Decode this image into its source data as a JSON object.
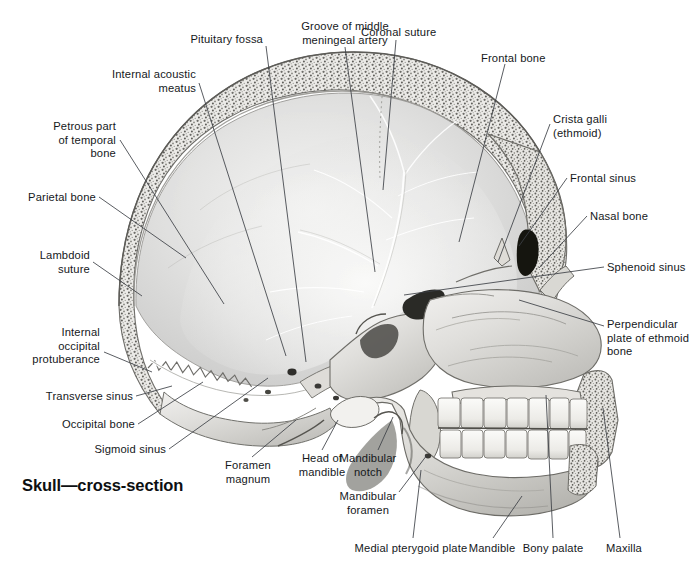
{
  "plate": {
    "title": "Skull—cross-section",
    "title_pos": {
      "x": 22,
      "y": 476
    },
    "background": "#ffffff",
    "ink": "#15181b",
    "leader_color": "#3c4046",
    "width": 697,
    "height": 577
  },
  "labels": [
    {
      "id": "pituitary-fossa",
      "text": "Pituitary fossa",
      "align": "right",
      "x": 263,
      "y": 33,
      "lines": 1,
      "leader": [
        [
          266,
          46
        ],
        [
          306,
          362
        ]
      ]
    },
    {
      "id": "groove-of-middle-meningeal-artery",
      "text": "Groove of middle\nmeningeal artery",
      "align": "center",
      "x": 345,
      "y": 20,
      "lines": 2,
      "leader": [
        [
          345,
          47
        ],
        [
          375,
          272
        ]
      ]
    },
    {
      "id": "coronal-suture",
      "text": "Coronal suture",
      "align": "left",
      "x": 361,
      "y": 26,
      "lines": 1,
      "leader": [
        [
          396,
          40
        ],
        [
          383,
          190
        ]
      ]
    },
    {
      "id": "frontal-bone",
      "text": "Frontal bone",
      "align": "left",
      "x": 481,
      "y": 52,
      "lines": 1,
      "leader": [
        [
          505,
          64
        ],
        [
          459,
          242
        ]
      ]
    },
    {
      "id": "internal-acoustic-meatus",
      "text": "Internal acoustic\nmeatus",
      "align": "right",
      "x": 196,
      "y": 68,
      "lines": 2,
      "leader": [
        [
          199,
          83
        ],
        [
          286,
          356
        ]
      ]
    },
    {
      "id": "crista-galli-ethmoid",
      "text": "Crista galli\n(ethmoid)",
      "align": "left",
      "x": 553,
      "y": 113,
      "lines": 2,
      "leader": [
        [
          550,
          124
        ],
        [
          498,
          262
        ]
      ]
    },
    {
      "id": "petrous-part-of-temporal-bone",
      "text": "Petrous part\nof temporal\nbone",
      "align": "right",
      "x": 116,
      "y": 120,
      "lines": 3,
      "leader": [
        [
          120,
          140
        ],
        [
          224,
          304
        ]
      ]
    },
    {
      "id": "frontal-sinus",
      "text": "Frontal sinus",
      "align": "left",
      "x": 570,
      "y": 172,
      "lines": 1,
      "leader": [
        [
          567,
          178
        ],
        [
          519,
          246
        ]
      ]
    },
    {
      "id": "parietal-bone",
      "text": "Parietal bone",
      "align": "right",
      "x": 96,
      "y": 191,
      "lines": 1,
      "leader": [
        [
          99,
          197
        ],
        [
          186,
          258
        ]
      ]
    },
    {
      "id": "nasal-bone",
      "text": "Nasal bone",
      "align": "left",
      "x": 590,
      "y": 210,
      "lines": 1,
      "leader": [
        [
          587,
          216
        ],
        [
          539,
          268
        ]
      ]
    },
    {
      "id": "lambdoid-suture",
      "text": "Lambdoid\nsuture",
      "align": "right",
      "x": 90,
      "y": 249,
      "lines": 2,
      "leader": [
        [
          93,
          262
        ],
        [
          142,
          296
        ]
      ]
    },
    {
      "id": "sphenoid-sinus",
      "text": "Sphenoid sinus",
      "align": "left",
      "x": 607,
      "y": 261,
      "lines": 1,
      "leader": [
        [
          604,
          267
        ],
        [
          404,
          295
        ]
      ]
    },
    {
      "id": "perpendicular-plate-of-ethmoid-bone",
      "text": "Perpendicular\nplate of ethmoid\nbone",
      "align": "left",
      "x": 607,
      "y": 318,
      "lines": 3,
      "leader": [
        [
          604,
          326
        ],
        [
          519,
          300
        ]
      ]
    },
    {
      "id": "internal-occipital-protuberance",
      "text": "Internal\noccipital\nprotuberance",
      "align": "right",
      "x": 100,
      "y": 326,
      "lines": 3,
      "leader": [
        [
          104,
          352
        ],
        [
          152,
          372
        ]
      ]
    },
    {
      "id": "transverse-sinus",
      "text": "Transverse sinus",
      "align": "right",
      "x": 133,
      "y": 390,
      "lines": 1,
      "leader": [
        [
          136,
          396
        ],
        [
          172,
          386
        ]
      ]
    },
    {
      "id": "occipital-bone",
      "text": "Occipital bone",
      "align": "right",
      "x": 135,
      "y": 418,
      "lines": 1,
      "leader": [
        [
          138,
          424
        ],
        [
          203,
          382
        ]
      ]
    },
    {
      "id": "sigmoid-sinus",
      "text": "Sigmoid sinus",
      "align": "right",
      "x": 166,
      "y": 443,
      "lines": 1,
      "leader": [
        [
          169,
          449
        ],
        [
          268,
          378
        ]
      ]
    },
    {
      "id": "foramen-magnum",
      "text": "Foramen\nmagnum",
      "align": "center",
      "x": 248,
      "y": 459,
      "lines": 2,
      "leader": [
        [
          252,
          457
        ],
        [
          296,
          420
        ]
      ]
    },
    {
      "id": "head-of-mandible",
      "text": "Head of\nmandible",
      "align": "center",
      "x": 322,
      "y": 452,
      "lines": 2,
      "leader": [
        [
          322,
          450
        ],
        [
          338,
          420
        ]
      ]
    },
    {
      "id": "mandibular-notch",
      "text": "Mandibular\nnotch",
      "align": "center",
      "x": 368,
      "y": 452,
      "lines": 2,
      "leader": [
        [
          378,
          450
        ],
        [
          393,
          417
        ]
      ]
    },
    {
      "id": "mandibular-foamen",
      "text": "Mandibular\nforamen",
      "align": "center",
      "x": 368,
      "y": 490,
      "lines": 2,
      "leader": [
        [
          399,
          492
        ],
        [
          427,
          455
        ]
      ]
    },
    {
      "id": "medial-pterygoid-plate",
      "text": "Medial pterygoid plate",
      "align": "center",
      "x": 411,
      "y": 542,
      "lines": 1,
      "leader": [
        [
          413,
          538
        ],
        [
          421,
          470
        ]
      ]
    },
    {
      "id": "mandible",
      "text": "Mandible",
      "align": "center",
      "x": 492,
      "y": 542,
      "lines": 1,
      "leader": [
        [
          493,
          538
        ],
        [
          522,
          496
        ]
      ]
    },
    {
      "id": "bony-palate",
      "text": "Bony palate",
      "align": "center",
      "x": 553,
      "y": 542,
      "lines": 1,
      "leader": [
        [
          553,
          538
        ],
        [
          546,
          395
        ]
      ]
    },
    {
      "id": "maxilla",
      "text": "Maxilla",
      "align": "center",
      "x": 624,
      "y": 542,
      "lines": 1,
      "leader": [
        [
          620,
          538
        ],
        [
          603,
          408
        ]
      ]
    }
  ]
}
